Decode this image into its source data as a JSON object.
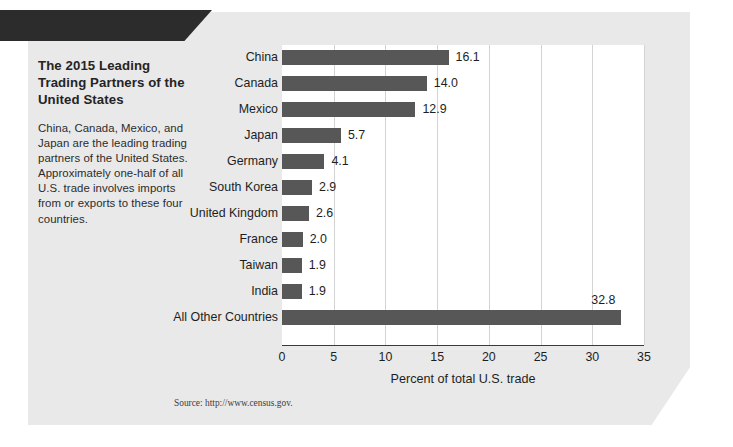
{
  "banner": {
    "label": "EXHIBIT 2"
  },
  "exhibit": {
    "title": "The 2015 Leading Trading Partners of the United States",
    "description": "China, Canada, Mexico, and Japan are the leading trading partners of the United States. Approximately one-half of all U.S. trade involves imports from or exports to these four countries.",
    "source": "Source: http://www.census.gov."
  },
  "colors": {
    "banner_bg": "#2c2c2c",
    "panel_bg": "#e9e9e9",
    "bar": "#575757",
    "plot_bg": "#ffffff",
    "gridline": "#d3d3d3",
    "text": "#1e1e1e"
  },
  "chart_data": {
    "type": "bar",
    "orientation": "horizontal",
    "title": "The 2015 Leading Trading Partners of the United States",
    "xlabel": "Percent of total U.S. trade",
    "ylabel": "",
    "xlim": [
      0,
      35
    ],
    "xticks": [
      0,
      5,
      10,
      15,
      20,
      25,
      30,
      35
    ],
    "grid": true,
    "legend": false,
    "categories": [
      "China",
      "Canada",
      "Mexico",
      "Japan",
      "Germany",
      "South Korea",
      "United Kingdom",
      "France",
      "Taiwan",
      "India",
      "All Other Countries"
    ],
    "values": [
      16.1,
      14.0,
      12.9,
      5.7,
      4.1,
      2.9,
      2.6,
      2.0,
      1.9,
      1.9,
      32.8
    ],
    "value_labels": [
      "16.1",
      "14.0",
      "12.9",
      "5.7",
      "4.1",
      "2.9",
      "2.6",
      "2.0",
      "1.9",
      "1.9",
      "32.8"
    ]
  }
}
